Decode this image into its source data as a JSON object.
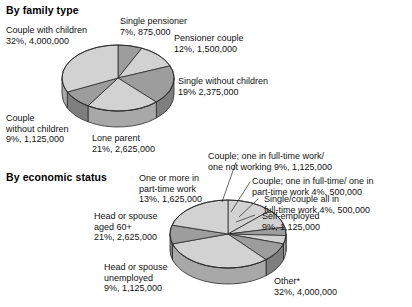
{
  "page": {
    "background": "#ffffff",
    "text_color": "#111111"
  },
  "palette": {
    "slice_light": "#d2d2d2",
    "slice_dark": "#9d9d9d",
    "side_light": "#bdbdbd",
    "side_dark": "#8a8a8a",
    "outline": "#2b2b2b"
  },
  "charts": [
    {
      "id": "family-type",
      "title": "By family type",
      "labels": {
        "single_pensioner": {
          "line1": "Single pensioner",
          "line2": "7%,  875,000"
        },
        "pensioner_couple": {
          "line1": "Pensioner couple",
          "line2": "12%,  1,500,000"
        },
        "single_without_children": {
          "line1": "Single without children",
          "line2": "19%  2,375,000"
        },
        "lone_parent": {
          "line1": "Lone parent",
          "line2": "21%,  2,625,000"
        },
        "couple_without_children": {
          "line1": "Couple",
          "line2": "without children",
          "line3": "9%,  1,125,000"
        },
        "couple_with_children": {
          "line1": "Couple with children",
          "line2": "32%,  4,000,000"
        }
      }
    },
    {
      "id": "economic-status",
      "title": "By economic status",
      "labels": {
        "part_time": {
          "line1": "One or more in",
          "line2": "part-time work",
          "line3": "13%,  1,625,000"
        },
        "aged_60": {
          "line1": "Head or spouse",
          "line2": "aged 60+",
          "line3": "21%,  2,625,000"
        },
        "unemployed": {
          "line1": "Head or spouse",
          "line2": "unemployed",
          "line3": "9%,  1,125,000"
        },
        "other": {
          "line1": "Other*",
          "line2": "32%, 4,000,000"
        },
        "self_employed": {
          "line1": "Self-employed",
          "line2": "9%,  1,125,000"
        },
        "single_couple_full_time": {
          "line1": "Single/couple all in",
          "line2": "full-time work 4%,  500,000"
        },
        "couple_full_part": {
          "line1": "Couple; one in full-time/ one in",
          "line2": "part-time work 4%,  500,000"
        },
        "couple_full_not_working": {
          "line1": "Couple; one in full-time work/",
          "line2": "one not working 9%,  1,125,000"
        }
      }
    }
  ],
  "chart_data": [
    {
      "type": "pie",
      "title": "By family type",
      "id": "family-type",
      "unit": "households",
      "categories": [
        "Single pensioner",
        "Pensioner couple",
        "Single without children",
        "Lone parent",
        "Couple without children",
        "Couple with children"
      ],
      "values_percent": [
        7,
        12,
        19,
        21,
        9,
        32
      ],
      "values_absolute": [
        875000,
        1500000,
        2375000,
        2625000,
        1125000,
        4000000
      ],
      "value_labels": [
        "7%,  875,000",
        "12%,  1,500,000",
        "19%  2,375,000",
        "21%,  2,625,000",
        "9%,  1,125,000",
        "32%,  4,000,000"
      ],
      "slice_fills": [
        "#9d9d9d",
        "#d2d2d2",
        "#9d9d9d",
        "#d2d2d2",
        "#9d9d9d",
        "#d2d2d2"
      ],
      "start_angle_deg": -90,
      "legend": "labels-outside",
      "three_d": true
    },
    {
      "type": "pie",
      "title": "By economic status",
      "id": "economic-status",
      "unit": "households",
      "categories": [
        "One or more in part-time work",
        "Couple; one in full-time work/ one not working",
        "Couple; one in full-time/ one in part-time work",
        "Single/couple all in full-time work",
        "Self-employed",
        "Other*",
        "Head or spouse unemployed",
        "Head or spouse aged 60+"
      ],
      "values_percent": [
        13,
        9,
        4,
        4,
        9,
        32,
        9,
        21
      ],
      "values_absolute": [
        1625000,
        1125000,
        500000,
        500000,
        1125000,
        4000000,
        1125000,
        2625000
      ],
      "value_labels": [
        "13%,  1,625,000",
        "9%,  1,125,000",
        "4%,  500,000",
        "4%,  500,000",
        "9%,  1,125,000",
        "32%, 4,000,000",
        "9%,  1,125,000",
        "21%,  2,625,000"
      ],
      "slice_fills": [
        "#d2d2d2",
        "#d2d2d2",
        "#9d9d9d",
        "#d2d2d2",
        "#9d9d9d",
        "#d2d2d2",
        "#9d9d9d",
        "#d2d2d2"
      ],
      "start_angle_deg": -90,
      "legend": "labels-outside",
      "three_d": true
    }
  ]
}
